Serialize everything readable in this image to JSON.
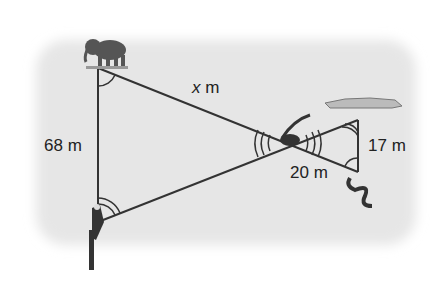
{
  "diagram": {
    "type": "similar-triangles",
    "background_color": "#e6e6e6",
    "line_color": "#333333",
    "points": {
      "elephant": {
        "x": 98,
        "y": 68,
        "label": "elephant"
      },
      "bird": {
        "x": 98,
        "y": 222,
        "label": "bird"
      },
      "lizard": {
        "x": 288,
        "y": 143,
        "label": "lizard (intersection)"
      },
      "crocodile": {
        "x": 358,
        "y": 120,
        "label": "crocodile"
      },
      "snake": {
        "x": 358,
        "y": 172,
        "label": "snake"
      }
    },
    "labels": {
      "hypotenuse_large": {
        "var": "x",
        "unit": " m"
      },
      "side_large": "68 m",
      "side_small": "17 m",
      "segment_small": "20 m"
    }
  }
}
